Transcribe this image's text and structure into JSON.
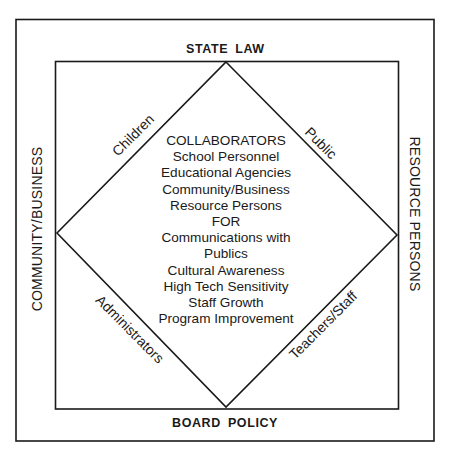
{
  "diagram": {
    "outer_labels": {
      "top": "STATE LAW",
      "bottom": "BOARD POLICY",
      "left": "COMMUNITY/BUSINESS",
      "right": "RESOURCE PERSONS"
    },
    "diamond_edge_labels": {
      "top_left": "Children",
      "top_right": "Public",
      "bottom_left": "Administrators",
      "bottom_right": "Teachers/Staff"
    },
    "center_text": [
      "COLLABORATORS",
      "School Personnel",
      "Educational Agencies",
      "Community/Business",
      "Resource Persons",
      "FOR",
      "Communications with",
      "Publics",
      "Cultural Awareness",
      "High Tech Sensitivity",
      "Staff Growth",
      "Program Improvement"
    ],
    "colors": {
      "line": "#1a1a1a",
      "background": "#ffffff"
    }
  }
}
